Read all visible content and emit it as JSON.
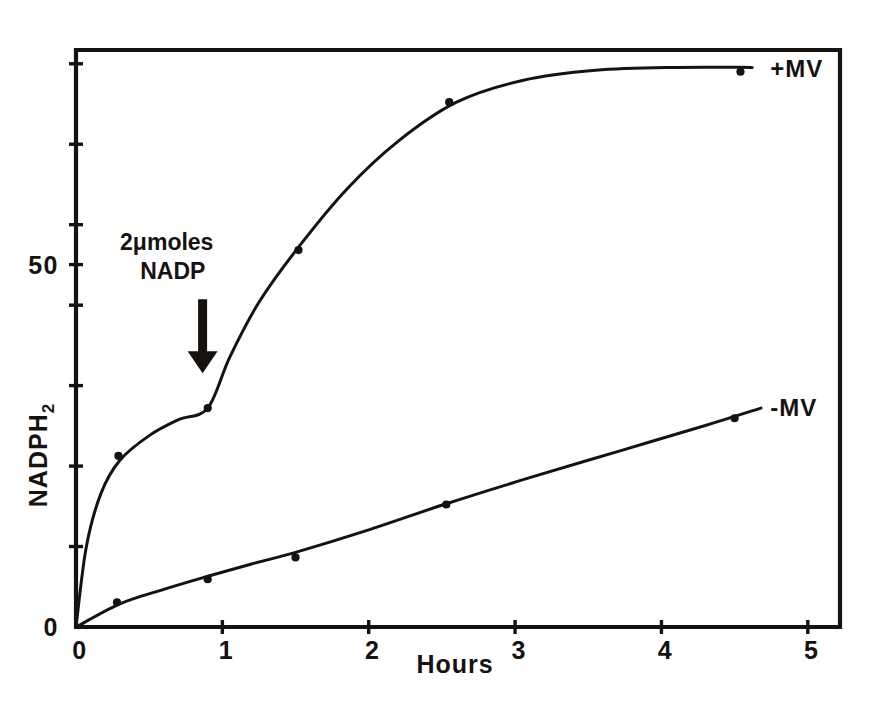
{
  "chart_data": {
    "type": "line",
    "title": "",
    "xlabel": "Hours",
    "ylabel": "NADPH2",
    "ylabel_base": "NADPH",
    "ylabel_sub": "2",
    "xlim": [
      0,
      5.22
    ],
    "ylim": [
      0,
      79.6
    ],
    "xticks": [
      0,
      1,
      2,
      3,
      4,
      5
    ],
    "xticklabels": [
      "0",
      "1",
      "2",
      "3",
      "4",
      "5"
    ],
    "yticks": [
      0,
      11.1,
      22.2,
      33.3,
      44.4,
      50,
      55.5,
      66.6,
      77.7
    ],
    "yticklabels": [
      "0",
      "",
      "",
      "",
      "",
      "50",
      "",
      "",
      ""
    ],
    "grid": false,
    "legend_position": "right-inline",
    "series": [
      {
        "name": "+MV",
        "label": "+MV",
        "label_x": 4.62,
        "label_y": 77.0,
        "points": [
          {
            "x": 0.0,
            "y": 0.0
          },
          {
            "x": 0.29,
            "y": 23.6
          },
          {
            "x": 0.9,
            "y": 30.2
          },
          {
            "x": 1.52,
            "y": 52.0
          },
          {
            "x": 2.55,
            "y": 72.4
          },
          {
            "x": 4.54,
            "y": 76.6
          }
        ],
        "curve": [
          {
            "x": 0.0,
            "y": 0.0
          },
          {
            "x": 0.07,
            "y": 11.0
          },
          {
            "x": 0.17,
            "y": 18.4
          },
          {
            "x": 0.3,
            "y": 23.0
          },
          {
            "x": 0.5,
            "y": 26.4
          },
          {
            "x": 0.7,
            "y": 28.6
          },
          {
            "x": 0.9,
            "y": 30.2
          },
          {
            "x": 1.05,
            "y": 37.2
          },
          {
            "x": 1.25,
            "y": 44.8
          },
          {
            "x": 1.52,
            "y": 52.4
          },
          {
            "x": 1.85,
            "y": 60.4
          },
          {
            "x": 2.2,
            "y": 67.0
          },
          {
            "x": 2.6,
            "y": 72.4
          },
          {
            "x": 3.05,
            "y": 75.4
          },
          {
            "x": 3.55,
            "y": 76.8
          },
          {
            "x": 4.1,
            "y": 77.2
          },
          {
            "x": 4.62,
            "y": 77.2
          }
        ]
      },
      {
        "name": "-MV",
        "label": "-MV",
        "label_x": 4.62,
        "label_y": 30.2,
        "points": [
          {
            "x": 0.0,
            "y": 0.0
          },
          {
            "x": 0.28,
            "y": 3.4
          },
          {
            "x": 0.9,
            "y": 6.6
          },
          {
            "x": 1.5,
            "y": 9.6
          },
          {
            "x": 2.53,
            "y": 16.9
          },
          {
            "x": 4.5,
            "y": 28.8
          }
        ],
        "curve": [
          {
            "x": 0.0,
            "y": 0.0
          },
          {
            "x": 0.3,
            "y": 3.2
          },
          {
            "x": 0.6,
            "y": 5.2
          },
          {
            "x": 0.9,
            "y": 7.0
          },
          {
            "x": 1.2,
            "y": 8.7
          },
          {
            "x": 1.5,
            "y": 10.3
          },
          {
            "x": 2.0,
            "y": 13.4
          },
          {
            "x": 2.53,
            "y": 17.0
          },
          {
            "x": 3.1,
            "y": 20.6
          },
          {
            "x": 3.7,
            "y": 24.2
          },
          {
            "x": 4.3,
            "y": 27.8
          },
          {
            "x": 4.68,
            "y": 30.2
          }
        ]
      }
    ],
    "annotation": {
      "line1": "2",
      "line1_symbol": "μ",
      "line1_rest": "moles",
      "line1_full": "2μmoles",
      "line2": "NADP",
      "text_x": 0.62,
      "text_y": 52.0,
      "arrow_x": 0.865,
      "arrow_from_y": 45.2,
      "arrow_to_y": 35.0
    },
    "colors": {
      "ink": "#16120f",
      "background": "#ffffff"
    }
  }
}
